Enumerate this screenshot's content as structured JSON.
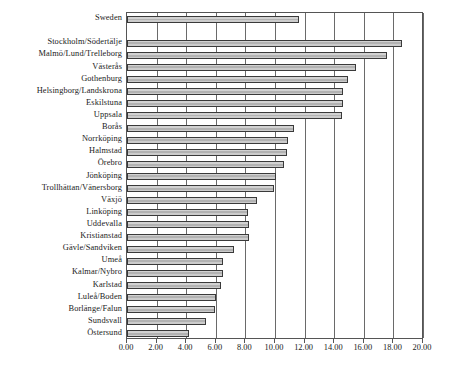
{
  "chart_data": {
    "type": "bar",
    "orientation": "horizontal",
    "title": "",
    "subtitle": "",
    "xlabel": "",
    "ylabel": "",
    "xlim": [
      0.0,
      20.0
    ],
    "grid": true,
    "legend": null,
    "legend_position": "none",
    "tick_format": "2-decimals",
    "tick_labels": [
      "0.00",
      "2.00",
      "4.00",
      "6.00",
      "8.00",
      "10.00",
      "12.00",
      "14.00",
      "16.00",
      "18.00",
      "20.00"
    ],
    "tick_values": [
      0,
      2,
      4,
      6,
      8,
      10,
      12,
      14,
      16,
      18,
      20
    ],
    "categories": [
      "Sweden",
      "Stockholm/Södertälje",
      "Malmö/Lund/Trelleborg",
      "Västerås",
      "Gothenburg",
      "Helsingborg/Landskrona",
      "Eskilstuna",
      "Uppsala",
      "Borås",
      "Norrköping",
      "Halmstad",
      "Örebro",
      "Jönköping",
      "Trollhättan/Vänersborg",
      "Växjö",
      "Linköping",
      "Uddevalla",
      "Kristianstad",
      "Gävle/Sandviken",
      "Umeå",
      "Kalmar/Nybro",
      "Karlstad",
      "Luleå/Boden",
      "Borlänge/Falun",
      "Sundsvall",
      "Östersund"
    ],
    "values": [
      11.6,
      18.6,
      17.6,
      15.5,
      14.9,
      14.6,
      14.6,
      14.5,
      11.3,
      10.9,
      10.8,
      10.6,
      10.1,
      9.9,
      8.8,
      8.2,
      8.25,
      8.25,
      7.2,
      6.5,
      6.5,
      6.35,
      6.0,
      5.95,
      5.35,
      4.2
    ],
    "group_gap_after_index": 0,
    "colors": {
      "bar_fill": "#c2c2c2",
      "bar_edge": "#3a3a3a",
      "grid": "#6a6a6a",
      "frame": "#555555",
      "text": "#1a1a1a",
      "background": "#ffffff"
    }
  }
}
